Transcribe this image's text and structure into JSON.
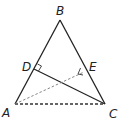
{
  "diagram": {
    "type": "geometry-triangle",
    "points": {
      "A": {
        "label": "A",
        "x": 15,
        "y": 104
      },
      "B": {
        "label": "B",
        "x": 60,
        "y": 20
      },
      "C": {
        "label": "C",
        "x": 105,
        "y": 104
      },
      "D": {
        "label": "D",
        "x": 34,
        "y": 69
      },
      "E": {
        "label": "E",
        "x": 84,
        "y": 72
      }
    },
    "segments": [
      {
        "from": "A",
        "to": "B",
        "style": "solid"
      },
      {
        "from": "B",
        "to": "C",
        "style": "solid"
      },
      {
        "from": "A",
        "to": "C",
        "style": "dashed"
      },
      {
        "from": "C",
        "to": "D",
        "style": "solid"
      },
      {
        "from": "A",
        "to": "E",
        "style": "dashed"
      }
    ],
    "right_angles": [
      "D",
      "E"
    ],
    "colors": {
      "line": "#222222",
      "dashed": "#555555"
    }
  }
}
